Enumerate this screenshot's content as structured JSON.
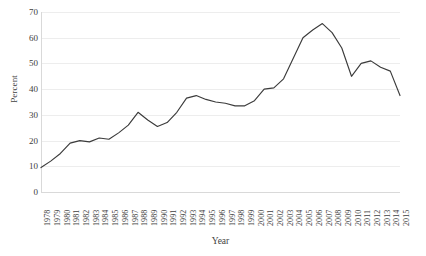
{
  "chart_data": {
    "type": "line",
    "title": "",
    "xlabel": "Year",
    "ylabel": "Percent",
    "ylim": [
      0,
      70
    ],
    "yticks": [
      0,
      10,
      20,
      30,
      40,
      50,
      60,
      70
    ],
    "grid": true,
    "legend_position": "none",
    "line_color": "#3b3b3b",
    "grid_color": "#ededed",
    "categories": [
      "1978",
      "1979",
      "1980",
      "1981",
      "1982",
      "1983",
      "1984",
      "1985",
      "1986",
      "1987",
      "1988",
      "1989",
      "1990",
      "1991",
      "1992",
      "1993",
      "1994",
      "1995",
      "1996",
      "1997",
      "1998",
      "1999",
      "2000",
      "2001",
      "2002",
      "2003",
      "2004",
      "2005",
      "2006",
      "2007",
      "2008",
      "2009",
      "2010",
      "2011",
      "2012",
      "2013",
      "2014",
      "2015"
    ],
    "series": [
      {
        "name": "Percent",
        "values": [
          9.5,
          12,
          15,
          19,
          20,
          19.5,
          21,
          20.5,
          23,
          26,
          31,
          28,
          25.5,
          27,
          31,
          36.5,
          37.5,
          36,
          35,
          34.5,
          33.5,
          33.5,
          35.5,
          40,
          40.5,
          44,
          52,
          60,
          63,
          65.5,
          62,
          56,
          45,
          50,
          51,
          48.5,
          47,
          37.5
        ]
      }
    ]
  }
}
